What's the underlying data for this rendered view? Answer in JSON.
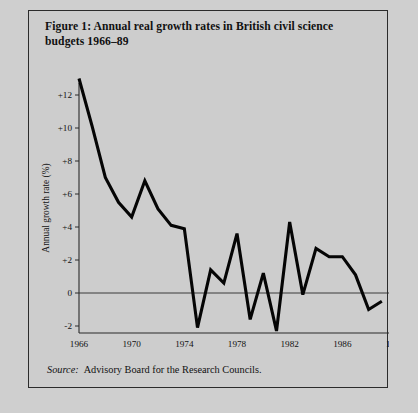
{
  "figure": {
    "title": "Figure 1: Annual real growth rates in British civil science budgets 1966–89",
    "source_label": "Source:",
    "source_text": "Advisory Board for the Research Councils."
  },
  "colors": {
    "page_background": "#cfcfcf",
    "frame_background": "#cdcdcd",
    "frame_border": "#2b2b2b",
    "line": "#050505",
    "axis": "#2b2b2b",
    "text": "#111111"
  },
  "chart_data": {
    "type": "line",
    "title": "Figure 1: Annual real growth rates in British civil science budgets 1966–89",
    "xlabel": "",
    "ylabel": "Annual growth rate (%)",
    "xlim": [
      1966,
      1990
    ],
    "ylim": [
      -3,
      13.5
    ],
    "grid": false,
    "legend": null,
    "zero_reference_line": 0,
    "ytick_labels": [
      "+12",
      "+10",
      "+8",
      "+6",
      "+4",
      "+2",
      "0",
      "-2"
    ],
    "yticks": [
      12,
      10,
      8,
      6,
      4,
      2,
      0,
      -2
    ],
    "xtick_labels": [
      "1966",
      "1970",
      "1974",
      "1978",
      "1982",
      "1986",
      "1990"
    ],
    "xticks": [
      1966,
      1970,
      1974,
      1978,
      1982,
      1986,
      1990
    ],
    "x": [
      1966,
      1967,
      1968,
      1969,
      1970,
      1971,
      1972,
      1973,
      1974,
      1975,
      1976,
      1977,
      1978,
      1979,
      1980,
      1981,
      1982,
      1983,
      1984,
      1985,
      1986,
      1987,
      1988,
      1989
    ],
    "values": [
      13.0,
      10.1,
      7.0,
      5.5,
      4.6,
      6.8,
      5.1,
      4.1,
      3.9,
      -2.1,
      1.4,
      0.6,
      3.6,
      -1.6,
      1.2,
      -2.3,
      4.3,
      -0.1,
      2.7,
      2.2,
      2.2,
      1.1,
      -1.0,
      -0.5
    ],
    "series": [
      {
        "name": "Annual real growth rate",
        "values": [
          13.0,
          10.1,
          7.0,
          5.5,
          4.6,
          6.8,
          5.1,
          4.1,
          3.9,
          -2.1,
          1.4,
          0.6,
          3.6,
          -1.6,
          1.2,
          -2.3,
          4.3,
          -0.1,
          2.7,
          2.2,
          2.2,
          1.1,
          -1.0,
          -0.5
        ]
      }
    ]
  }
}
